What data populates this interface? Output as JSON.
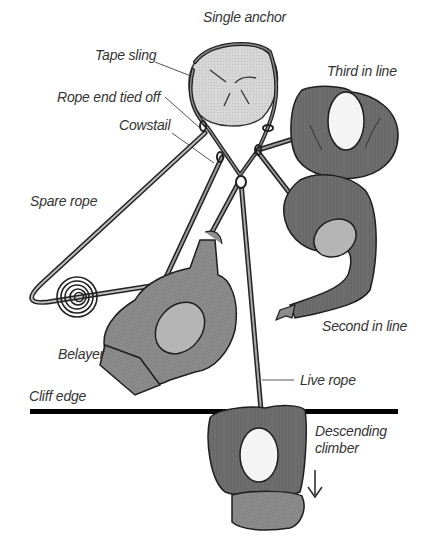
{
  "diagram": {
    "labels": {
      "single_anchor": "Single anchor",
      "tape_sling": "Tape sling",
      "third_in_line": "Third in line",
      "rope_end_tied_off": "Rope end tied off",
      "cowstail": "Cowstail",
      "spare_rope": "Spare rope",
      "second_in_line": "Second in line",
      "belayer": "Belayer",
      "live_rope": "Live rope",
      "cliff_edge": "Cliff edge",
      "descending_climber_1": "Descending",
      "descending_climber_2": "climber"
    },
    "colors": {
      "anchor_fill": "#d4d4d4",
      "figure_dark": "#6e6e6e",
      "figure_mid": "#8c8c8c",
      "helmet_light": "#f4f4f4",
      "helmet_grey": "#b5b5b5",
      "outline": "#1e1e1e",
      "cliff_line": "#000000",
      "leader_line": "#555555"
    }
  }
}
